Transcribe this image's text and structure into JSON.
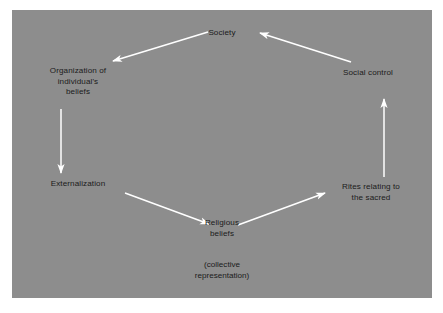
{
  "figure": {
    "background_color": "#ffffff",
    "panel_color": "#8d8d8d",
    "text_color": "#1b1b1b",
    "arrow_color": "#ffffff"
  },
  "diagram": {
    "type": "cycle",
    "nodes": [
      {
        "id": "society",
        "label": "Society",
        "lines": [
          "Society"
        ],
        "position": "top-center"
      },
      {
        "id": "organization",
        "label": "Organization of individual's beliefs",
        "lines": [
          "Organization of",
          "individual's",
          "beliefs"
        ],
        "position": "upper-left"
      },
      {
        "id": "externalization",
        "label": "Externalization",
        "lines": [
          "Externalization"
        ],
        "position": "lower-left"
      },
      {
        "id": "religious_beliefs",
        "label": "Religious beliefs",
        "lines": [
          "Religious",
          "beliefs"
        ],
        "position": "bottom-center",
        "note_lines": [
          "(collective",
          "representation)"
        ]
      },
      {
        "id": "rites",
        "label": "Rites relating to the sacred",
        "lines": [
          "Rites relating to",
          "the sacred"
        ],
        "position": "lower-right"
      },
      {
        "id": "social_control",
        "label": "Social control",
        "lines": [
          "Social control"
        ],
        "position": "upper-right"
      }
    ],
    "edges": [
      {
        "from": "society",
        "to": "organization",
        "direction": "down-left"
      },
      {
        "from": "organization",
        "to": "externalization",
        "direction": "down"
      },
      {
        "from": "externalization",
        "to": "religious_beliefs",
        "direction": "down-right"
      },
      {
        "from": "religious_beliefs",
        "to": "rites",
        "direction": "up-right"
      },
      {
        "from": "rites",
        "to": "social_control",
        "direction": "up"
      },
      {
        "from": "social_control",
        "to": "society",
        "direction": "up-left"
      }
    ]
  }
}
